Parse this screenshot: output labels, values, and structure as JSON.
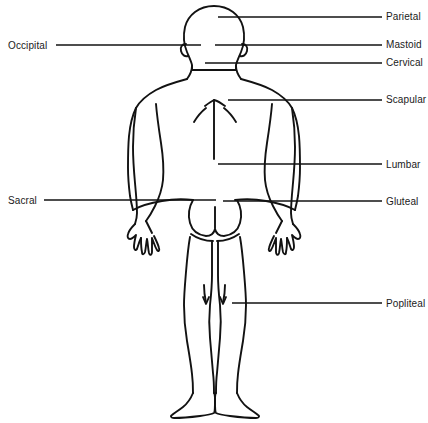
{
  "figure": {
    "view": "posterior",
    "background_color": "#ffffff",
    "line_color": "#121212",
    "text_color": "#1a1a1a"
  },
  "labels": {
    "left": [
      {
        "id": "occipital",
        "text": "Occipital",
        "text_x": 8,
        "text_y": 40,
        "line": {
          "x1": 56,
          "y1": 45,
          "x2": 201,
          "y2": 45
        }
      },
      {
        "id": "sacral",
        "text": "Sacral",
        "text_x": 8,
        "text_y": 195,
        "line": {
          "x1": 44,
          "y1": 200,
          "x2": 216,
          "y2": 200
        }
      }
    ],
    "right": [
      {
        "id": "parietal",
        "text": "Parietal",
        "text_x": 386,
        "text_y": 11,
        "line": {
          "x1": 218,
          "y1": 17,
          "x2": 382,
          "y2": 17
        }
      },
      {
        "id": "mastoid",
        "text": "Mastoid",
        "text_x": 386,
        "text_y": 39,
        "line": {
          "x1": 215,
          "y1": 45,
          "x2": 382,
          "y2": 45
        }
      },
      {
        "id": "cervical",
        "text": "Cervical",
        "text_x": 386,
        "text_y": 57,
        "line": {
          "x1": 205,
          "y1": 63,
          "x2": 382,
          "y2": 63
        }
      },
      {
        "id": "scapular",
        "text": "Scapular",
        "text_x": 386,
        "text_y": 94,
        "line": {
          "x1": 228,
          "y1": 100,
          "x2": 382,
          "y2": 100
        }
      },
      {
        "id": "lumbar",
        "text": "Lumbar",
        "text_x": 386,
        "text_y": 159,
        "line": {
          "x1": 218,
          "y1": 164,
          "x2": 382,
          "y2": 164
        }
      },
      {
        "id": "gluteal",
        "text": "Gluteal",
        "text_x": 386,
        "text_y": 196,
        "line": {
          "x1": 223,
          "y1": 201,
          "x2": 382,
          "y2": 201
        }
      },
      {
        "id": "popliteal",
        "text": "Popliteal",
        "text_x": 386,
        "text_y": 298,
        "line": {
          "x1": 232,
          "y1": 303,
          "x2": 382,
          "y2": 303
        }
      }
    ]
  }
}
